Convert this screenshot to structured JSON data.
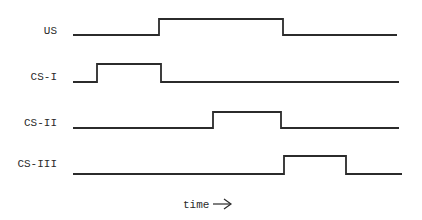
{
  "diagram": {
    "type": "timing-diagram",
    "signals": [
      {
        "label": "US",
        "low_y": 35,
        "high_y": 19,
        "x_start": 73,
        "x_end": 397,
        "on": 159,
        "off": 283
      },
      {
        "label": "CS-I",
        "low_y": 82,
        "high_y": 64,
        "x_start": 73,
        "x_end": 399,
        "on": 97,
        "off": 161
      },
      {
        "label": "CS-II",
        "low_y": 128,
        "high_y": 112,
        "x_start": 73,
        "x_end": 399,
        "on": 213,
        "off": 281
      },
      {
        "label": "CS-III",
        "low_y": 174,
        "high_y": 156,
        "x_start": 73,
        "x_end": 402,
        "on": 284,
        "off": 346
      }
    ],
    "axis_label": "time",
    "axis_arrow": "→",
    "line_color": "#2b2b2b"
  }
}
